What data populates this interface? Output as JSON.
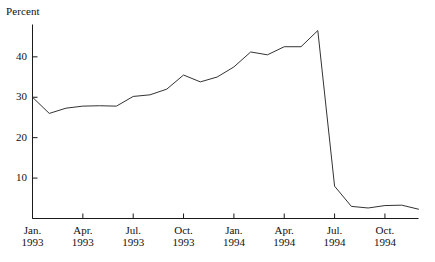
{
  "chart_data": {
    "type": "line",
    "title": "",
    "ylabel": "Percent",
    "xlabel": "",
    "ylim": [
      0,
      48
    ],
    "xlim": [
      0,
      23
    ],
    "grid": false,
    "legend": null,
    "y_ticks": [
      10,
      20,
      30,
      40
    ],
    "y_tick_labels": [
      "10",
      "20",
      "30",
      "40"
    ],
    "x_ticks": [
      0,
      3,
      6,
      9,
      12,
      15,
      18,
      21
    ],
    "x_tick_labels": [
      {
        "month": "Jan.",
        "year": "1993"
      },
      {
        "month": "Apr.",
        "year": "1993"
      },
      {
        "month": "Jul.",
        "year": "1993"
      },
      {
        "month": "Oct.",
        "year": "1993"
      },
      {
        "month": "Jan.",
        "year": "1994"
      },
      {
        "month": "Apr.",
        "year": "1994"
      },
      {
        "month": "Jul.",
        "year": "1994"
      },
      {
        "month": "Oct.",
        "year": "1994"
      }
    ],
    "x": [
      0,
      1,
      2,
      3,
      4,
      5,
      6,
      7,
      8,
      9,
      10,
      11,
      12,
      13,
      14,
      15,
      16,
      17,
      18,
      19,
      20,
      21,
      22,
      23
    ],
    "categories": [
      "Jan. 1993",
      "Feb. 1993",
      "Mar. 1993",
      "Apr. 1993",
      "May 1993",
      "Jun. 1993",
      "Jul. 1993",
      "Aug. 1993",
      "Sep. 1993",
      "Oct. 1993",
      "Nov. 1993",
      "Dec. 1993",
      "Jan. 1994",
      "Feb. 1994",
      "Mar. 1994",
      "Apr. 1994",
      "May 1994",
      "Jun. 1994",
      "Jul. 1994",
      "Aug. 1994",
      "Sep. 1994",
      "Oct. 1994",
      "Nov. 1994",
      "Dec. 1994"
    ],
    "values": [
      30.0,
      26.0,
      27.3,
      27.8,
      27.9,
      27.8,
      30.2,
      30.6,
      32.0,
      35.5,
      33.8,
      35.0,
      37.5,
      41.2,
      40.5,
      42.5,
      42.5,
      46.5,
      8.0,
      3.0,
      2.6,
      3.2,
      3.3,
      2.3
    ],
    "series_color": "#333333",
    "axis_color": "#1a1a1a"
  },
  "axis": {
    "y_title": "Percent"
  }
}
